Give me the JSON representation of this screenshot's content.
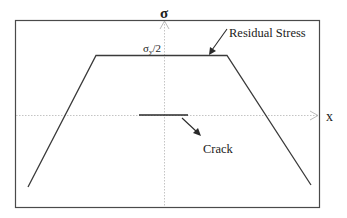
{
  "diagram": {
    "axes": {
      "y_label": "σ",
      "x_label": "x"
    },
    "labels": {
      "plateau_symbol": "σ",
      "plateau_subscript": "y",
      "plateau_suffix": "/2",
      "residual_stress": "Residual Stress",
      "crack": "Crack"
    },
    "colors": {
      "frame": "#4a4a4a",
      "axis": "#b5b5b5",
      "profile": "#3a3a3a",
      "text": "#222222"
    }
  }
}
